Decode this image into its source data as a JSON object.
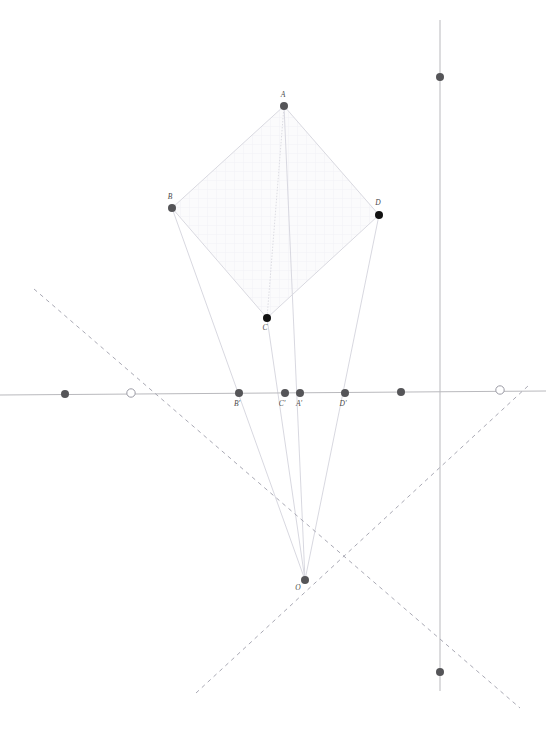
{
  "figure": {
    "title": "",
    "type": "euclidean-geometry-diagram",
    "width": 546,
    "height": 729,
    "background_color": "#ffffff"
  },
  "colors": {
    "axis_line": "#b9b9bd",
    "dashed_line": "#a9a9b4",
    "ray_line": "#d4d4dc",
    "polygon_edge": "#d9d9e0",
    "polygon_fill": "#fbfbfc",
    "grid_hatch": "#f4f4f7",
    "point_dark": "#111111",
    "point_gray": "#555558",
    "point_open_stroke": "#9b9ba5",
    "label_text": "#4a4a4a"
  },
  "lines": {
    "horizontal_axis": {
      "name": "horizontal-axis",
      "x1": 0,
      "y1": 395,
      "x2": 546,
      "y2": 391
    },
    "vertical_axis": {
      "name": "vertical-axis",
      "x1": 440,
      "y1": 20,
      "x2": 440,
      "y2": 691
    },
    "dashed_down_right": {
      "name": "dashed-line-descending",
      "x1": 34,
      "y1": 289,
      "x2": 520,
      "y2": 708
    },
    "dashed_down_left": {
      "name": "dashed-line-ascending",
      "x1": 196,
      "y1": 693,
      "x2": 528,
      "y2": 386
    }
  },
  "polygon": {
    "name": "quadrilateral-ABDC",
    "vertices_order": [
      "A",
      "B",
      "C",
      "D"
    ],
    "path": "284,106 172,208 267,318 379,215"
  },
  "points": [
    {
      "id": "A",
      "label": "A",
      "x": 284,
      "y": 106,
      "style": "gray",
      "label_dx": -1,
      "label_dy": -9
    },
    {
      "id": "B",
      "label": "B",
      "x": 172,
      "y": 208,
      "style": "gray",
      "label_dx": -2,
      "label_dy": -9
    },
    {
      "id": "C",
      "label": "C",
      "x": 267,
      "y": 318,
      "style": "dark",
      "label_dx": -2,
      "label_dy": 12
    },
    {
      "id": "D",
      "label": "D",
      "x": 379,
      "y": 215,
      "style": "dark",
      "label_dx": -1,
      "label_dy": -10
    },
    {
      "id": "Bp",
      "label": "B'",
      "x": 239,
      "y": 393,
      "style": "gray",
      "label_dx": -2,
      "label_dy": 13
    },
    {
      "id": "Cp",
      "label": "C'",
      "x": 285,
      "y": 393,
      "style": "gray",
      "label_dx": -3,
      "label_dy": 13
    },
    {
      "id": "Ap",
      "label": "A'",
      "x": 300,
      "y": 393,
      "style": "gray",
      "label_dx": -1,
      "label_dy": 13
    },
    {
      "id": "Dp",
      "label": "D'",
      "x": 345,
      "y": 393,
      "style": "gray",
      "label_dx": -2,
      "label_dy": 13
    },
    {
      "id": "O",
      "label": "O",
      "x": 305,
      "y": 580,
      "style": "gray",
      "label_dx": -7,
      "label_dy": 10
    },
    {
      "id": "P1",
      "label": "",
      "x": 65,
      "y": 394,
      "style": "gray",
      "label_dx": 0,
      "label_dy": 0
    },
    {
      "id": "P2",
      "label": "",
      "x": 401,
      "y": 392,
      "style": "gray",
      "label_dx": 0,
      "label_dy": 0
    },
    {
      "id": "P3",
      "label": "",
      "x": 440,
      "y": 77,
      "style": "gray",
      "label_dx": 0,
      "label_dy": 0
    },
    {
      "id": "P4",
      "label": "",
      "x": 440,
      "y": 672,
      "style": "gray",
      "label_dx": 0,
      "label_dy": 0
    },
    {
      "id": "U1",
      "label": "",
      "x": 131,
      "y": 393,
      "style": "open",
      "label_dx": 0,
      "label_dy": 0
    },
    {
      "id": "U2",
      "label": "",
      "x": 500,
      "y": 390,
      "style": "open",
      "label_dx": 0,
      "label_dy": 0
    }
  ],
  "rays": [
    {
      "name": "ray-O-to-A",
      "x1": 305,
      "y1": 580,
      "x2": 284,
      "y2": 106
    },
    {
      "name": "ray-O-to-B",
      "x1": 305,
      "y1": 580,
      "x2": 172,
      "y2": 208
    },
    {
      "name": "ray-O-to-C",
      "x1": 305,
      "y1": 580,
      "x2": 267,
      "y2": 318
    },
    {
      "name": "ray-O-to-D",
      "x1": 305,
      "y1": 580,
      "x2": 379,
      "y2": 215
    }
  ],
  "internal_segments": [
    {
      "name": "segment-A-to-C",
      "x1": 284,
      "y1": 106,
      "x2": 267,
      "y2": 318
    }
  ]
}
